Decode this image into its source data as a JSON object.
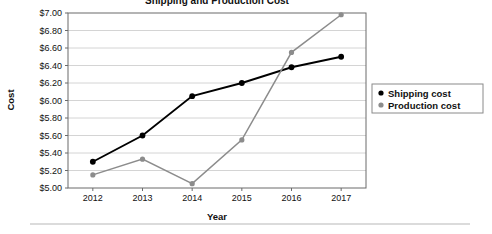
{
  "chart_data": {
    "type": "line",
    "title": "Shipping and Production Cost",
    "xlabel": "Year",
    "ylabel": "Cost",
    "categories": [
      "2012",
      "2013",
      "2014",
      "2015",
      "2016",
      "2017"
    ],
    "x": [
      2012,
      2013,
      2014,
      2015,
      2016,
      2017
    ],
    "series": [
      {
        "name": "Shipping cost",
        "color": "#000000",
        "values": [
          5.3,
          5.6,
          6.05,
          6.2,
          6.38,
          6.5
        ]
      },
      {
        "name": "Production cost",
        "color": "#8c8c8c",
        "values": [
          5.15,
          5.33,
          5.05,
          5.55,
          6.55,
          6.98
        ]
      }
    ],
    "ylim": [
      5.0,
      7.0
    ],
    "ytick_step": 0.2,
    "ytick_labels": [
      "$5.00",
      "$5.20",
      "$5.40",
      "$5.60",
      "$5.80",
      "$6.00",
      "$6.20",
      "$6.40",
      "$6.60",
      "$6.80",
      "$7.00"
    ],
    "ytick_values": [
      5.0,
      5.2,
      5.4,
      5.6,
      5.8,
      6.0,
      6.2,
      6.4,
      6.6,
      6.8,
      7.0
    ],
    "xtick_labels": [
      "2012",
      "2013",
      "2014",
      "2015",
      "2016",
      "2017"
    ],
    "grid": "horizontal",
    "legend_position": "right",
    "legend_entries": [
      "Shipping cost",
      "Production cost"
    ]
  },
  "legend": {
    "entries": [
      {
        "label": "Shipping cost",
        "marker": "dot-black-icon"
      },
      {
        "label": "Production cost",
        "marker": "dot-gray-icon"
      }
    ]
  },
  "axes": {
    "x_title": "Year",
    "y_title": "Cost"
  }
}
